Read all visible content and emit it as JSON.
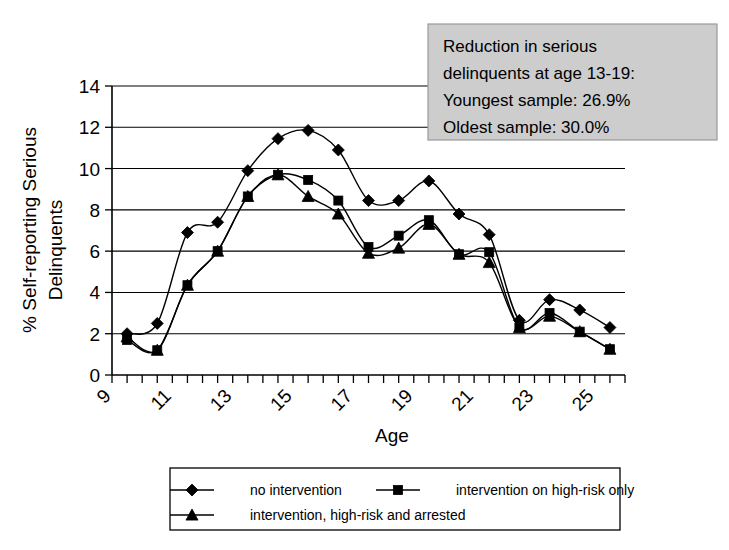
{
  "chart_data": {
    "type": "line",
    "title": "",
    "xlabel": "Age",
    "ylabel": "% Self-reporting Serious Delinquents",
    "xlim": [
      9,
      26
    ],
    "ylim": [
      0,
      14
    ],
    "y_ticks": [
      0,
      2,
      4,
      6,
      8,
      10,
      12,
      14
    ],
    "x_ticks": [
      9,
      9.5,
      10,
      10.5,
      11,
      11.5,
      12,
      12.5,
      13,
      13.5,
      14,
      14.5,
      15,
      15.5,
      16,
      16.5,
      17,
      17.5,
      18,
      18.5,
      19,
      19.5,
      20,
      20.5,
      21,
      21.5,
      22,
      22.5,
      23,
      23.5,
      24,
      24.5,
      25,
      25.5,
      26
    ],
    "x_tick_labels": [
      "9",
      "11",
      "13",
      "15",
      "17",
      "19",
      "21",
      "23",
      "25"
    ],
    "x_tick_label_values": [
      9,
      11,
      13,
      15,
      17,
      19,
      21,
      23,
      25
    ],
    "x_tick_label_rotation": -45,
    "grid": "horizontal",
    "legend_position": "bottom",
    "x": [
      9.5,
      10.5,
      11.5,
      12.5,
      13.5,
      14.5,
      15.5,
      16.5,
      17.5,
      18.5,
      19.5,
      20.5,
      21.5,
      22.5,
      23.5,
      24.5,
      25.5
    ],
    "series": [
      {
        "name": "no intervention",
        "marker": "diamond",
        "values": [
          2.0,
          2.5,
          6.9,
          7.4,
          9.9,
          11.45,
          11.85,
          10.9,
          8.45,
          8.45,
          9.4,
          7.8,
          6.8,
          2.65,
          3.65,
          3.15,
          2.3
        ]
      },
      {
        "name": "intervention on high-risk only",
        "marker": "square",
        "values": [
          1.7,
          1.2,
          4.35,
          6.0,
          8.65,
          9.7,
          9.45,
          8.45,
          6.2,
          6.75,
          7.5,
          5.85,
          5.95,
          2.3,
          3.0,
          2.1,
          1.25
        ]
      },
      {
        "name": "intervention, high-risk and arrested",
        "marker": "triangle",
        "values": [
          1.85,
          1.2,
          4.35,
          6.0,
          8.65,
          9.7,
          8.65,
          7.8,
          5.9,
          6.15,
          7.3,
          5.85,
          5.45,
          2.3,
          2.85,
          2.1,
          1.25
        ]
      }
    ],
    "annotations": [
      {
        "name": "reduction-callout",
        "lines": [
          "Reduction in serious",
          "delinquents at age 13-19:",
          "Youngest sample: 26.9%",
          "Oldest sample: 30.0%"
        ],
        "background_color": "#cdcdcd",
        "border_color": "#9a9a9a"
      }
    ]
  },
  "legend": {
    "items": [
      {
        "label": "no intervention",
        "marker": "diamond"
      },
      {
        "label": "intervention on high-risk only",
        "marker": "square"
      },
      {
        "label": "intervention, high-risk and arrested",
        "marker": "triangle"
      }
    ]
  },
  "axes": {
    "x_title": "Age",
    "y_title_line1": "% Self-reporting Serious",
    "y_title_line2": "Delinquents"
  },
  "colors": {
    "ink": "#000000",
    "background": "#ffffff",
    "annotation_fill": "#cdcdcd",
    "annotation_border": "#9a9a9a"
  }
}
